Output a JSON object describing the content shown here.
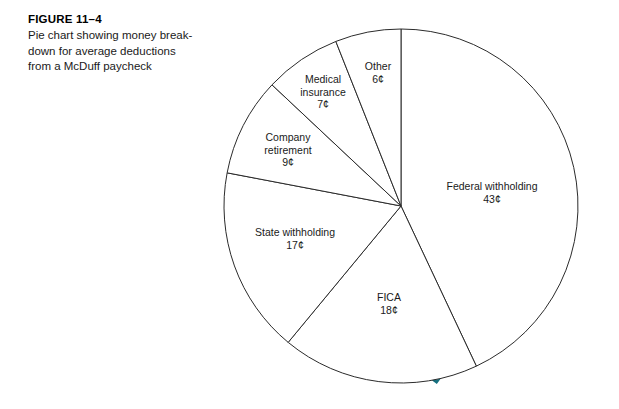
{
  "caption": {
    "figure_number": "FIGURE 11–4",
    "description_lines": [
      "Pie chart showing money break-",
      "down for average deductions",
      "from a McDuff paycheck"
    ]
  },
  "colors": {
    "shadow_teal": "#15707f",
    "outline": "#2b2b2b",
    "slice_fill": "#ffffff",
    "text": "#1a1a1a",
    "background": "#ffffff"
  },
  "chart_data": {
    "type": "pie",
    "unit": "¢",
    "total": 100,
    "start_angle_deg": 0,
    "direction": "clockwise",
    "legend": "none",
    "labels_inline": true,
    "categories": [
      "Federal withholding",
      "FICA",
      "State withholding",
      "Company retirement",
      "Medical insurance",
      "Other"
    ],
    "values": [
      43,
      18,
      17,
      9,
      7,
      6
    ],
    "value_labels": [
      "43¢",
      "18¢",
      "17¢",
      "9¢",
      "7¢",
      "6¢"
    ],
    "slices": [
      {
        "name": "Federal withholding",
        "value": 43,
        "value_label": "43¢",
        "label_lines": [
          "Federal withholding"
        ],
        "label_x": 492,
        "label_y": 192
      },
      {
        "name": "FICA",
        "value": 18,
        "value_label": "18¢",
        "label_lines": [
          "FICA"
        ],
        "label_x": 389,
        "label_y": 303
      },
      {
        "name": "State withholding",
        "value": 17,
        "value_label": "17¢",
        "label_lines": [
          "State withholding"
        ],
        "label_x": 295,
        "label_y": 238
      },
      {
        "name": "Company retirement",
        "value": 9,
        "value_label": "9¢",
        "label_lines": [
          "Company",
          "retirement"
        ],
        "label_x": 288,
        "label_y": 150
      },
      {
        "name": "Medical insurance",
        "value": 7,
        "value_label": "7¢",
        "label_lines": [
          "Medical",
          "insurance"
        ],
        "label_x": 323,
        "label_y": 92
      },
      {
        "name": "Other",
        "value": 6,
        "value_label": "6¢",
        "label_lines": [
          "Other"
        ],
        "label_x": 378,
        "label_y": 72
      }
    ]
  }
}
